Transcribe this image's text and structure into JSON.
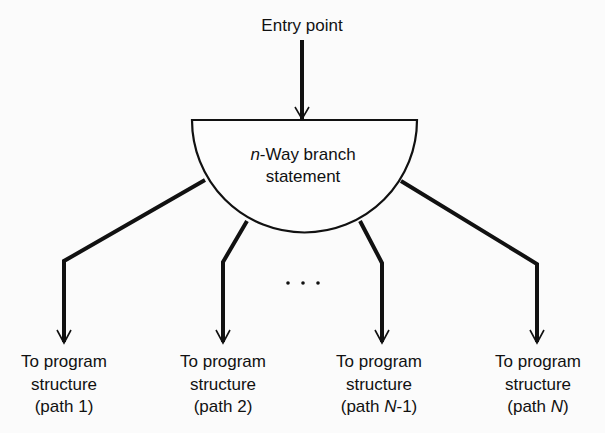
{
  "diagram": {
    "entry": {
      "label": "Entry point"
    },
    "branch_node": {
      "prefix": "n",
      "line1_rest": "-Way branch",
      "line2": "statement",
      "shape": "semicircle"
    },
    "ellipsis": "· · ·",
    "outputs": [
      {
        "line1": "To program",
        "line2": "structure",
        "line3_pre": "(path ",
        "line3_var": "",
        "line3_post": "1)"
      },
      {
        "line1": "To program",
        "line2": "structure",
        "line3_pre": "(path ",
        "line3_var": "",
        "line3_post": "2)"
      },
      {
        "line1": "To program",
        "line2": "structure",
        "line3_pre": "(path ",
        "line3_var": "N",
        "line3_post": "-1)"
      },
      {
        "line1": "To program",
        "line2": "structure",
        "line3_pre": "(path ",
        "line3_var": "N",
        "line3_post": ")"
      }
    ],
    "colors": {
      "line": "#111111",
      "background": "#fbfbfb"
    }
  }
}
